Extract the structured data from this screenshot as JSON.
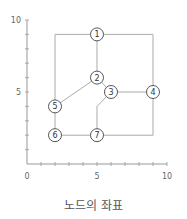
{
  "caption": "노드의 좌표",
  "axes": {
    "x_ticks": [
      {
        "value": 0,
        "label": "0"
      },
      {
        "value": 5,
        "label": "5"
      },
      {
        "value": 10,
        "label": "10"
      }
    ],
    "y_ticks": [
      {
        "value": 5,
        "label": "5"
      },
      {
        "value": 10,
        "label": "10"
      }
    ],
    "xlim": [
      0,
      10
    ],
    "ylim": [
      0,
      10
    ]
  },
  "nodes": [
    {
      "id": "1",
      "x": 5,
      "y": 9
    },
    {
      "id": "2",
      "x": 5,
      "y": 6
    },
    {
      "id": "3",
      "x": 6,
      "y": 5
    },
    {
      "id": "4",
      "x": 9,
      "y": 5
    },
    {
      "id": "5",
      "x": 2,
      "y": 4
    },
    {
      "id": "6",
      "x": 2,
      "y": 2
    },
    {
      "id": "7",
      "x": 5,
      "y": 2
    }
  ],
  "edges": [
    {
      "from": "1",
      "to": "5",
      "via": [
        [
          2,
          9
        ]
      ]
    },
    {
      "from": "1",
      "to": "4",
      "via": [
        [
          9,
          9
        ]
      ]
    },
    {
      "from": "1",
      "to": "2",
      "via": []
    },
    {
      "from": "2",
      "to": "5",
      "via": []
    },
    {
      "from": "2",
      "to": "3",
      "via": []
    },
    {
      "from": "3",
      "to": "4",
      "via": []
    },
    {
      "from": "3",
      "to": "7",
      "via": [
        [
          5,
          4
        ]
      ]
    },
    {
      "from": "5",
      "to": "6",
      "via": []
    },
    {
      "from": "6",
      "to": "7",
      "via": []
    },
    {
      "from": "4",
      "to": "7",
      "via": [
        [
          9,
          2
        ]
      ]
    }
  ],
  "colors": {
    "axis": "#999999",
    "edge": "#aaaaaa",
    "node_stroke": "#555555",
    "node_fill": "#ffffff"
  }
}
